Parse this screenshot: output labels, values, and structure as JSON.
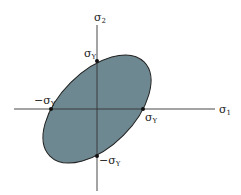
{
  "diagram": {
    "type": "yield-locus",
    "axes": {
      "horizontal_label": "σ",
      "horizontal_sub": "1",
      "vertical_label": "σ",
      "vertical_sub": "2"
    },
    "intercepts": {
      "top": {
        "label": "σ",
        "sub": "Y"
      },
      "right": {
        "label": "σ",
        "sub": "Y"
      },
      "left": {
        "label": "−σ",
        "sub": "Y"
      },
      "bottom": {
        "label": "−σ",
        "sub": "Y"
      }
    },
    "colors": {
      "fill": "#6e8891",
      "stroke": "#222222",
      "axis": "#333333"
    }
  }
}
